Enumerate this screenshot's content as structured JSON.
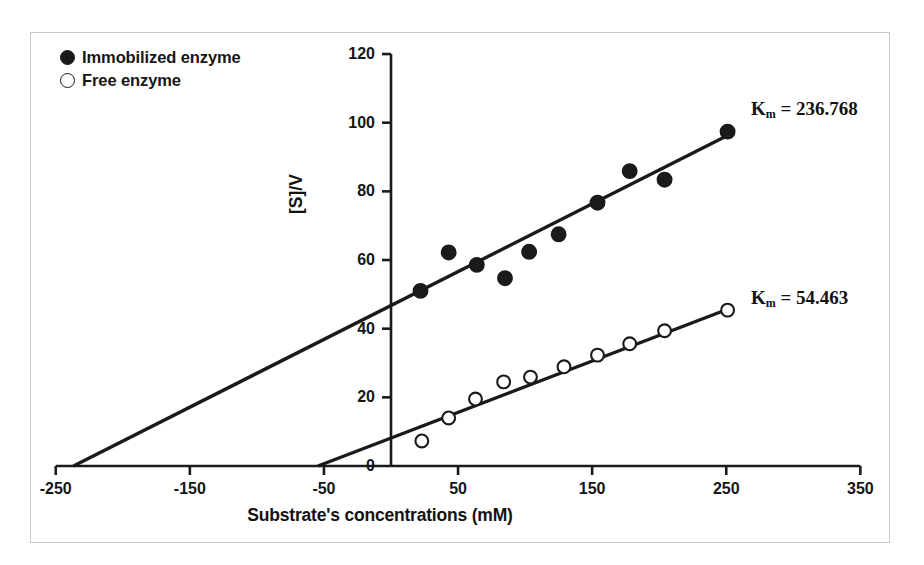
{
  "figure": {
    "background": "#ffffff",
    "frame_color": "#c9c9c9",
    "ink_color": "#1a1a1a"
  },
  "legend": {
    "position": "top-left",
    "items": [
      {
        "marker": "filled-circle-icon",
        "label": "Immobilized enzyme"
      },
      {
        "marker": "open-circle-icon",
        "label": "Free enzyme"
      }
    ]
  },
  "annotations": [
    {
      "name": "km-immobilized",
      "prefix": "K",
      "sub": "m",
      "rest": " = 236.768",
      "value": 236.768
    },
    {
      "name": "km-free",
      "prefix": "K",
      "sub": "m",
      "rest": " = 54.463",
      "value": 54.463
    }
  ],
  "chart_data": {
    "type": "scatter",
    "title": "",
    "xlabel": "Substrate's concentrations (mM)",
    "ylabel": "[S]/V",
    "xlim": [
      -250,
      350
    ],
    "ylim": [
      0,
      120
    ],
    "xticks": [
      -250,
      -150,
      -50,
      50,
      150,
      250,
      350
    ],
    "yticks": [
      0,
      20,
      40,
      60,
      80,
      100,
      120
    ],
    "xtick_labels": [
      "-250",
      "-150",
      "-50",
      "50",
      "150",
      "250",
      "350"
    ],
    "ytick_labels": [
      "0",
      "20",
      "40",
      "60",
      "80",
      "100",
      "120"
    ],
    "grid": false,
    "legend_position": "upper-left",
    "series": [
      {
        "name": "Immobilized enzyme",
        "marker": "filled-circle",
        "km": 236.768,
        "points": [
          {
            "x": 22,
            "y": 51.0
          },
          {
            "x": 43,
            "y": 62.2
          },
          {
            "x": 64,
            "y": 58.6
          },
          {
            "x": 85,
            "y": 54.7
          },
          {
            "x": 103,
            "y": 62.4
          },
          {
            "x": 125,
            "y": 67.5
          },
          {
            "x": 154,
            "y": 76.7
          },
          {
            "x": 178,
            "y": 85.9
          },
          {
            "x": 204,
            "y": 83.4
          },
          {
            "x": 251,
            "y": 97.4
          }
        ],
        "fit_line": {
          "x_start": -236.768,
          "y_start": 0,
          "x_end": 252,
          "y_end": 96.5
        }
      },
      {
        "name": "Free enzyme",
        "marker": "open-circle",
        "km": 54.463,
        "points": [
          {
            "x": 23,
            "y": 7.3
          },
          {
            "x": 43,
            "y": 14.0
          },
          {
            "x": 63,
            "y": 19.5
          },
          {
            "x": 84,
            "y": 24.5
          },
          {
            "x": 104,
            "y": 25.9
          },
          {
            "x": 129,
            "y": 28.9
          },
          {
            "x": 154,
            "y": 32.3
          },
          {
            "x": 178,
            "y": 35.6
          },
          {
            "x": 204,
            "y": 39.4
          },
          {
            "x": 251,
            "y": 45.4
          }
        ],
        "fit_line": {
          "x_start": -54.463,
          "y_start": 0,
          "x_end": 252,
          "y_end": 45.8
        }
      }
    ]
  }
}
